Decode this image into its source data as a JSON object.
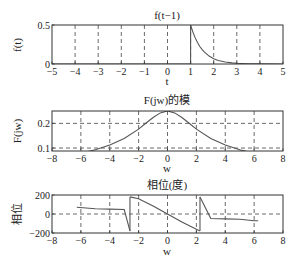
{
  "chart_data": [
    {
      "type": "line",
      "title": "f(t−1)",
      "xlabel": "t",
      "ylabel": "f(t)",
      "xlim": [
        -5,
        5
      ],
      "ylim": [
        0,
        0.5
      ],
      "xticks": [
        -5,
        -4,
        -3,
        -2,
        -1,
        0,
        1,
        2,
        3,
        4,
        5
      ],
      "xtick_labels": [
        "−5",
        "−4",
        "−3",
        "−2",
        "−1",
        "0",
        "1",
        "2",
        "3",
        "4",
        "5"
      ],
      "yticks": [
        0,
        0.5
      ],
      "ytick_labels": [
        "0",
        "0.5"
      ],
      "grid": "vertical dashed",
      "box": [
        52,
        25,
        283,
        64
      ],
      "series": [
        {
          "name": "f(t-1) = 0.5·e^(−2(t−1))·u(t−1)",
          "x": [
            -5,
            1,
            1,
            1.1,
            1.2,
            1.3,
            1.4,
            1.5,
            1.6,
            1.8,
            2.0,
            2.2,
            2.5,
            2.8,
            3.0,
            3.5,
            4,
            5
          ],
          "y": [
            0,
            0,
            0.5,
            0.409,
            0.335,
            0.274,
            0.225,
            0.184,
            0.151,
            0.101,
            0.068,
            0.045,
            0.025,
            0.014,
            0.009,
            0.003,
            0.001,
            0
          ]
        }
      ]
    },
    {
      "type": "line",
      "title": "F(jw)的模",
      "xlabel": "w",
      "ylabel": "F(jw)",
      "xlim": [
        -8,
        8
      ],
      "ylim": [
        0.088,
        0.25
      ],
      "xticks": [
        -8,
        -6,
        -4,
        -2,
        0,
        2,
        4,
        6,
        8
      ],
      "xtick_labels": [
        "−8",
        "−6",
        "−4",
        "−2",
        "0",
        "2",
        "4",
        "6",
        "8"
      ],
      "yticks": [
        0.1,
        0.2
      ],
      "ytick_labels": [
        "0.1",
        "0.2"
      ],
      "grid": "dashed both",
      "box": [
        52,
        111,
        283,
        151
      ],
      "series": [
        {
          "name": "|F(jw)| = 0.5/sqrt(4+w^2)",
          "x": [
            -6.28,
            -6,
            -5,
            -4,
            -3,
            -2,
            -1.5,
            -1,
            -0.5,
            0,
            0.5,
            1,
            1.5,
            2,
            3,
            4,
            5,
            6,
            6.28
          ],
          "y": [
            0.0758,
            0.0791,
            0.0928,
            0.1118,
            0.1387,
            0.1768,
            0.2,
            0.2236,
            0.2425,
            0.25,
            0.2425,
            0.2236,
            0.2,
            0.1768,
            0.1387,
            0.1118,
            0.0928,
            0.0791,
            0.0758
          ]
        }
      ]
    },
    {
      "type": "line",
      "title": "相位(度)",
      "xlabel": "w",
      "ylabel": "相位",
      "xlim": [
        -8,
        8
      ],
      "ylim": [
        -200,
        200
      ],
      "xticks": [
        -8,
        -6,
        -4,
        -2,
        0,
        2,
        4,
        6,
        8
      ],
      "xtick_labels": [
        "−8",
        "−6",
        "−4",
        "−2",
        "0",
        "2",
        "4",
        "6",
        "8"
      ],
      "yticks": [
        -200,
        0,
        200
      ],
      "ytick_labels": [
        "−200",
        "0",
        "200"
      ],
      "grid": "dashed both",
      "box": [
        52,
        195,
        283,
        233
      ],
      "series": [
        {
          "name": "phase = −w·180/π − atan(w/2)·180/π (wrapped)",
          "segments": [
            {
              "x": [
                -6.28,
                -5,
                -4,
                -3,
                -2.6
              ],
              "y": [
                72,
                55,
                52,
                47,
                -180
              ]
            },
            {
              "x": [
                -2.6,
                -2,
                -1,
                0,
                1,
                2,
                2.25
              ],
              "y": [
                180,
                160,
                84,
                0,
                -84,
                -160,
                -178
              ]
            },
            {
              "x": [
                2.25,
                3,
                4,
                5,
                6,
                6.28
              ],
              "y": [
                178,
                -47,
                -52,
                -55,
                -72,
                -72
              ]
            }
          ]
        }
      ]
    }
  ],
  "figure": {
    "titles": [
      "f(t−1)",
      "F(jw)的模",
      "相位(度)"
    ],
    "xlabels": [
      "t",
      "w",
      "w"
    ],
    "ylabels": [
      "f(t)",
      "F(jw)",
      "相位"
    ],
    "line_color": "#555555",
    "axis_color": "#333333"
  }
}
